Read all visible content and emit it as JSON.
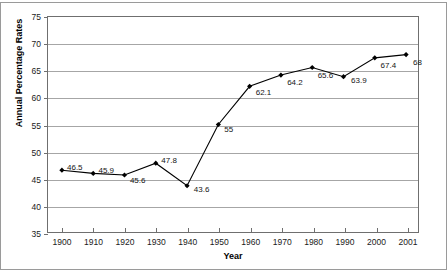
{
  "chart_data": {
    "type": "line",
    "title": "",
    "xlabel": "Year",
    "ylabel": "Annual Percentage Rates",
    "x": [
      1900,
      1910,
      1920,
      1930,
      1940,
      1950,
      1960,
      1970,
      1980,
      1990,
      2000,
      2001
    ],
    "xtick_labels": [
      "1900",
      "1910",
      "1920",
      "1930",
      "1940",
      "1950",
      "1960",
      "1970",
      "1980",
      "1990",
      "2000",
      "2001"
    ],
    "values": [
      46.5,
      45.9,
      45.6,
      47.8,
      43.6,
      55,
      62.1,
      64.2,
      65.6,
      63.9,
      67.4,
      68
    ],
    "point_labels": [
      "46.5",
      "45.9",
      "45.6",
      "47.8",
      "43.6",
      "55",
      "62.1",
      "64.2",
      "65.6",
      "63.9",
      "67.4",
      "68"
    ],
    "ylim": [
      35,
      75
    ],
    "ytick_labels": [
      "35",
      "40",
      "45",
      "50",
      "55",
      "60",
      "65",
      "70",
      "75"
    ],
    "yticks": [
      35,
      40,
      45,
      50,
      55,
      60,
      65,
      70,
      75
    ],
    "grid": "horizontal",
    "legend": "none",
    "series_color": "#000000",
    "marker": "diamond",
    "grid_color": "#a6a6a6",
    "axis_color": "#6f6f6f",
    "background": "#ffffff"
  }
}
